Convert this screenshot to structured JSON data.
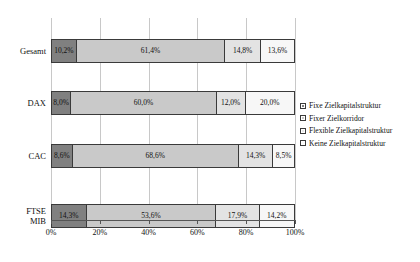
{
  "chart_data": {
    "type": "bar",
    "orientation": "horizontal",
    "stacked": true,
    "normalized_percent": true,
    "title": "",
    "subtitle": "",
    "xlabel": "",
    "ylabel": "",
    "xlim": [
      0,
      100
    ],
    "xticks": [
      0,
      20,
      40,
      60,
      80,
      100
    ],
    "xtick_labels": [
      "0%",
      "20%",
      "40%",
      "60%",
      "80%",
      "100%"
    ],
    "grid": "vertical",
    "legend_position": "right",
    "categories": [
      "Gesamt",
      "DAX",
      "CAC",
      "FTSE MIB"
    ],
    "category_label_lines": [
      [
        "Gesamt"
      ],
      [
        "DAX"
      ],
      [
        "CAC"
      ],
      [
        "FTSE",
        "MIB"
      ]
    ],
    "series": [
      {
        "name": "Fixe Zielkapitalstruktur",
        "color": "#808080",
        "values": [
          10.2,
          8.0,
          8.6,
          14.3
        ],
        "labels": [
          "10,2%",
          "8,0%",
          "8,6%",
          "14,3%"
        ]
      },
      {
        "name": "Fixer Zielkorridor",
        "color": "#c9c9c9",
        "values": [
          61.4,
          60.0,
          68.6,
          53.6
        ],
        "labels": [
          "61,4%",
          "60,0%",
          "68,6%",
          "53,6%"
        ]
      },
      {
        "name": "Flexible Zielkapitalstruktur",
        "color": "#e3e3e3",
        "values": [
          14.8,
          12.0,
          14.3,
          17.9
        ],
        "labels": [
          "14,8%",
          "12,0%",
          "14,3%",
          "17,9%"
        ]
      },
      {
        "name": "Keine Zielkapitalstruktur",
        "color": "#f7f7f7",
        "values": [
          13.6,
          20.0,
          8.5,
          14.2
        ],
        "labels": [
          "13,6%",
          "20,0%",
          "8,5%",
          "14,2%"
        ]
      }
    ]
  }
}
